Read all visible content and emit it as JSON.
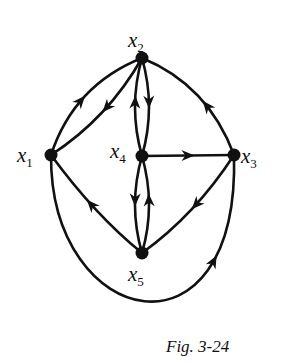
{
  "diagram": {
    "type": "directed-graph",
    "caption": "Fig. 3-24",
    "nodes": [
      {
        "id": "x1",
        "var": "x",
        "sub": "1"
      },
      {
        "id": "x2",
        "var": "x",
        "sub": "2"
      },
      {
        "id": "x3",
        "var": "x",
        "sub": "3"
      },
      {
        "id": "x4",
        "var": "x",
        "sub": "4"
      },
      {
        "id": "x5",
        "var": "x",
        "sub": "5"
      }
    ],
    "edges": [
      {
        "from": "x1",
        "to": "x2"
      },
      {
        "from": "x2",
        "to": "x1"
      },
      {
        "from": "x3",
        "to": "x2"
      },
      {
        "from": "x4",
        "to": "x2"
      },
      {
        "from": "x2",
        "to": "x4"
      },
      {
        "from": "x4",
        "to": "x3"
      },
      {
        "from": "x4",
        "to": "x5"
      },
      {
        "from": "x5",
        "to": "x4"
      },
      {
        "from": "x5",
        "to": "x1"
      },
      {
        "from": "x3",
        "to": "x5"
      },
      {
        "from": "x1",
        "to": "x3"
      }
    ]
  }
}
